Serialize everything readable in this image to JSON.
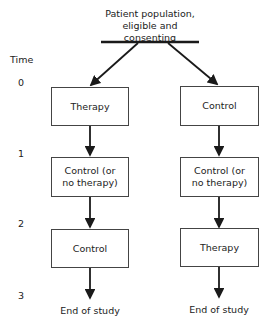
{
  "title": {
    "line1": "Patient population,",
    "line2": "eligible and consenting"
  },
  "time_axis": {
    "label": "Time",
    "ticks": [
      "0",
      "1",
      "2",
      "3"
    ]
  },
  "arms": [
    {
      "boxes": [
        "Therapy",
        "Control (or no therapy)",
        "Control"
      ],
      "end": "End of study"
    },
    {
      "boxes": [
        "Control",
        "Control (or no therapy)",
        "Therapy"
      ],
      "end": "End of study"
    }
  ],
  "colors": {
    "line": "#1a1a1a",
    "box_border": "#444444"
  }
}
